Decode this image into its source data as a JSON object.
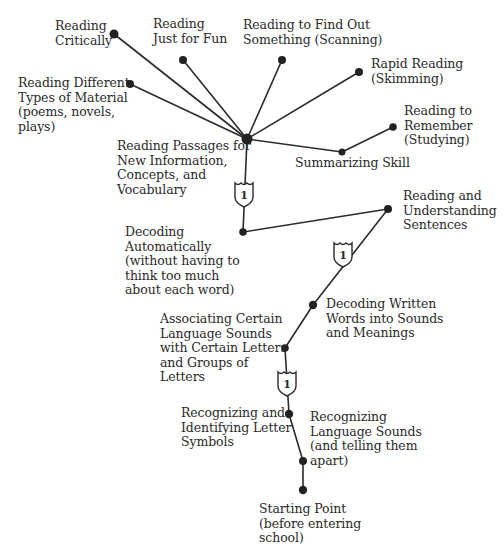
{
  "diagram": {
    "type": "reading-skills-road-map",
    "line_color": "#2a2a2a",
    "node_color": "#222222",
    "route_marker_label": "1",
    "nodes": [
      {
        "id": "reading-critically",
        "label": "Reading\nCritically",
        "x": 114,
        "y": 34
      },
      {
        "id": "just-for-fun",
        "label": "Reading\nJust for Fun",
        "x": 183,
        "y": 60
      },
      {
        "id": "find-out",
        "label": "Reading to Find Out\nSomething (Scanning)",
        "x": 282,
        "y": 60
      },
      {
        "id": "rapid-reading",
        "label": "Rapid Reading\n(Skimming)",
        "x": 359,
        "y": 72
      },
      {
        "id": "different-types",
        "label": "Reading Different\nTypes of Material\n(poems, novels,\nplays)",
        "x": 130,
        "y": 84
      },
      {
        "id": "remember",
        "label": "Reading to\nRemember\n(Studying)",
        "x": 393,
        "y": 127
      },
      {
        "id": "summarizing",
        "label": "Summarizing Skill",
        "x": 342,
        "y": 152
      },
      {
        "id": "passages",
        "label": "Reading Passages for\nNew Information,\nConcepts, and\nVocabulary",
        "x": 247,
        "y": 139
      },
      {
        "id": "decoding-auto",
        "label": "Decoding\nAutomatically\n(without having to\nthink too much\nabout each word)",
        "x": 243,
        "y": 232
      },
      {
        "id": "sentences",
        "label": "Reading and\nUnderstanding\nSentences",
        "x": 388,
        "y": 209
      },
      {
        "id": "decoding-written",
        "label": "Decoding Written\nWords into Sounds\nand Meanings",
        "x": 313,
        "y": 305
      },
      {
        "id": "associating",
        "label": "Associating Certain\nLanguage Sounds\nwith Certain Letters\nand Groups of\nLetters",
        "x": 285,
        "y": 348
      },
      {
        "id": "letter-symbols",
        "label": "Recognizing and\nIdentifying Letter\nSymbols",
        "x": 289,
        "y": 414
      },
      {
        "id": "language-sounds",
        "label": "Recognizing\nLanguage Sounds\n(and telling them\napart)",
        "x": 303,
        "y": 461
      },
      {
        "id": "starting-point",
        "label": "Starting Point\n(before entering\nschool)",
        "x": 303,
        "y": 490
      }
    ],
    "edges": [
      [
        "starting-point",
        "language-sounds"
      ],
      [
        "language-sounds",
        "letter-symbols"
      ],
      [
        "letter-symbols",
        "associating"
      ],
      [
        "associating",
        "decoding-written"
      ],
      [
        "decoding-written",
        "sentences"
      ],
      [
        "sentences",
        "decoding-auto"
      ],
      [
        "decoding-auto",
        "passages"
      ],
      [
        "passages",
        "reading-critically"
      ],
      [
        "passages",
        "just-for-fun"
      ],
      [
        "passages",
        "find-out"
      ],
      [
        "passages",
        "rapid-reading"
      ],
      [
        "passages",
        "different-types"
      ],
      [
        "passages",
        "summarizing"
      ],
      [
        "summarizing",
        "remember"
      ]
    ],
    "route_markers": [
      {
        "label": "1",
        "x": 244,
        "y": 194,
        "on_edge": "decoding-auto-passages"
      },
      {
        "label": "1",
        "x": 343,
        "y": 254,
        "on_edge": "decoding-written-sentences"
      },
      {
        "label": "1",
        "x": 287,
        "y": 383,
        "on_edge": "letter-symbols-associating"
      }
    ]
  },
  "labels": {
    "reading_critically": "Reading\nCritically",
    "just_for_fun": "Reading\nJust for Fun",
    "find_out": "Reading to Find Out\nSomething (Scanning)",
    "rapid_reading": "Rapid Reading\n(Skimming)",
    "different_types": "Reading Different\nTypes of Material\n(poems, novels,\nplays)",
    "remember": "Reading to\nRemember\n(Studying)",
    "summarizing": "Summarizing Skill",
    "passages": "Reading Passages for\nNew Information,\nConcepts, and\nVocabulary",
    "decoding_auto": "Decoding\nAutomatically\n(without having to\nthink too much\nabout each word)",
    "sentences": "Reading and\nUnderstanding\nSentences",
    "decoding_written": "Decoding Written\nWords into Sounds\nand Meanings",
    "associating": "Associating Certain\nLanguage Sounds\nwith Certain Letters\nand Groups of\nLetters",
    "letter_symbols": "Recognizing and\nIdentifying Letter\nSymbols",
    "language_sounds": "Recognizing\nLanguage Sounds\n(and telling them\napart)",
    "starting_point": "Starting Point\n(before entering\nschool)",
    "marker": "1"
  }
}
